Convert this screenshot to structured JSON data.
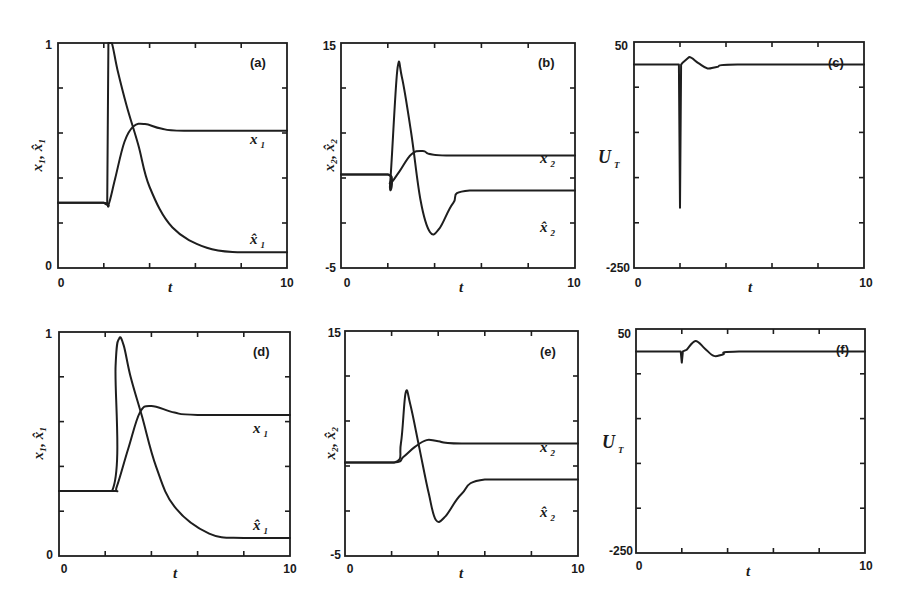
{
  "chart_data": [
    {
      "panel": "(a)",
      "type": "line",
      "xlabel": "t",
      "ylabel": "x1, x̂1",
      "xlim": [
        0,
        10
      ],
      "ylim": [
        0,
        1
      ],
      "xticks": [
        "0",
        "10"
      ],
      "yticks": [
        "0",
        "1"
      ],
      "series": [
        {
          "name": "x1",
          "x": [
            0,
            2.0,
            2.2,
            2.5,
            2.9,
            3.3,
            3.8,
            4.5,
            5.5,
            10
          ],
          "values": [
            0.29,
            0.29,
            0.28,
            0.4,
            0.56,
            0.63,
            0.64,
            0.62,
            0.61,
            0.61
          ]
        },
        {
          "name": "x̂1",
          "x": [
            0,
            2.0,
            2.15,
            2.2,
            2.35,
            2.6,
            3.0,
            3.5,
            4.0,
            5.0,
            6.5,
            8.0,
            10
          ],
          "values": [
            0.29,
            0.29,
            0.28,
            1.0,
            1.0,
            0.88,
            0.72,
            0.55,
            0.36,
            0.18,
            0.09,
            0.07,
            0.07
          ]
        }
      ]
    },
    {
      "panel": "(b)",
      "type": "line",
      "xlabel": "t",
      "ylabel": "x2, x̂2",
      "xlim": [
        0,
        10
      ],
      "ylim": [
        -5,
        15
      ],
      "xticks": [
        "0",
        "10"
      ],
      "yticks": [
        "-5",
        "15"
      ],
      "series": [
        {
          "name": "x2",
          "x": [
            0,
            2.0,
            2.1,
            2.5,
            3.0,
            3.5,
            4.5,
            10
          ],
          "values": [
            3.3,
            3.3,
            2.5,
            3.6,
            5.1,
            5.4,
            5.0,
            5.0
          ]
        },
        {
          "name": "x̂2",
          "x": [
            0,
            2.0,
            2.1,
            2.4,
            2.6,
            3.0,
            3.4,
            3.8,
            4.2,
            4.8,
            5.5,
            10
          ],
          "values": [
            3.3,
            3.3,
            2.5,
            12.5,
            12.0,
            7.0,
            1.0,
            -1.8,
            -1.5,
            0.8,
            1.9,
            1.9
          ]
        }
      ]
    },
    {
      "panel": "(c)",
      "type": "line",
      "xlabel": "t",
      "ylabel": "U_T",
      "xlim": [
        0,
        10
      ],
      "ylim": [
        -250,
        50
      ],
      "xticks": [
        "0",
        "10"
      ],
      "yticks": [
        "-250",
        "50"
      ],
      "series": [
        {
          "name": "U_T",
          "x": [
            0,
            1.95,
            2.0,
            2.05,
            2.1,
            2.4,
            2.8,
            3.2,
            3.6,
            4.5,
            10
          ],
          "values": [
            20,
            20,
            -170,
            20,
            22,
            30,
            22,
            15,
            17,
            20,
            20
          ]
        }
      ]
    },
    {
      "panel": "(d)",
      "type": "line",
      "xlabel": "t",
      "ylabel": "x1, x̂1",
      "xlim": [
        0,
        10
      ],
      "ylim": [
        0,
        1
      ],
      "xticks": [
        "0",
        "10"
      ],
      "yticks": [
        "0",
        "1"
      ],
      "series": [
        {
          "name": "x1",
          "x": [
            0,
            2.3,
            2.5,
            3.0,
            3.5,
            4.0,
            5.0,
            6.0,
            10
          ],
          "values": [
            0.29,
            0.29,
            0.31,
            0.48,
            0.64,
            0.67,
            0.64,
            0.63,
            0.63
          ]
        },
        {
          "name": "x̂1",
          "x": [
            0,
            2.3,
            2.45,
            2.6,
            2.8,
            3.1,
            3.6,
            4.2,
            5.0,
            6.5,
            8.0,
            10
          ],
          "values": [
            0.29,
            0.29,
            0.85,
            0.97,
            0.94,
            0.8,
            0.62,
            0.4,
            0.22,
            0.1,
            0.08,
            0.08
          ]
        }
      ]
    },
    {
      "panel": "(e)",
      "type": "line",
      "xlabel": "t",
      "ylabel": "x2, x̂2",
      "xlim": [
        0,
        10
      ],
      "ylim": [
        -5,
        15
      ],
      "xticks": [
        "0",
        "10"
      ],
      "yticks": [
        "-5",
        "15"
      ],
      "series": [
        {
          "name": "x2",
          "x": [
            0,
            2.1,
            2.5,
            3.0,
            3.5,
            4.0,
            5.0,
            10
          ],
          "values": [
            3.3,
            3.3,
            3.8,
            4.7,
            5.3,
            5.2,
            5.0,
            5.0
          ]
        },
        {
          "name": "x̂2",
          "x": [
            0,
            2.1,
            2.4,
            2.6,
            2.8,
            3.2,
            3.6,
            3.9,
            4.3,
            5.0,
            6.0,
            10
          ],
          "values": [
            3.3,
            3.3,
            5.0,
            9.5,
            8.5,
            4.5,
            0.5,
            -1.8,
            -1.5,
            0.5,
            1.8,
            1.8
          ]
        }
      ]
    },
    {
      "panel": "(f)",
      "type": "line",
      "xlabel": "t",
      "ylabel": "U_T",
      "xlim": [
        0,
        10
      ],
      "ylim": [
        -250,
        50
      ],
      "xticks": [
        "0",
        "10"
      ],
      "yticks": [
        "-250",
        "50"
      ],
      "series": [
        {
          "name": "U_T",
          "x": [
            0,
            1.95,
            2.0,
            2.05,
            2.2,
            2.6,
            3.0,
            3.4,
            3.8,
            4.5,
            10
          ],
          "values": [
            20,
            20,
            5,
            20,
            22,
            34,
            24,
            14,
            16,
            20,
            20
          ]
        }
      ]
    }
  ],
  "panels": {
    "a": {
      "tag": "(a)",
      "ytop": "1",
      "ybot": "0",
      "xleft": "0",
      "xright": "10",
      "xlabel": "t",
      "curve1": "x",
      "curve1_sub": "1",
      "curve2": "x̂",
      "curve2_sub": "1"
    },
    "b": {
      "tag": "(b)",
      "ytop": "15",
      "ybot": "-5",
      "xleft": "0",
      "xright": "10",
      "xlabel": "t",
      "curve1": "x",
      "curve1_sub": "2",
      "curve2": "x̂",
      "curve2_sub": "2"
    },
    "c": {
      "tag": "(c)",
      "ytop": "50",
      "ybot": "-250",
      "xleft": "0",
      "xright": "10",
      "xlabel": "t",
      "ylabel": "U",
      "ylabel_sub": "T"
    },
    "d": {
      "tag": "(d)",
      "ytop": "1",
      "ybot": "0",
      "xleft": "0",
      "xright": "10",
      "xlabel": "t",
      "curve1": "x",
      "curve1_sub": "1",
      "curve2": "x̂",
      "curve2_sub": "1"
    },
    "e": {
      "tag": "(e)",
      "ytop": "15",
      "ybot": "-5",
      "xleft": "0",
      "xright": "10",
      "xlabel": "t",
      "curve1": "x",
      "curve1_sub": "2",
      "curve2": "x̂",
      "curve2_sub": "2"
    },
    "f": {
      "tag": "(f)",
      "ytop": "50",
      "ybot": "-250",
      "xleft": "0",
      "xright": "10",
      "xlabel": "t",
      "ylabel": "U",
      "ylabel_sub": "T"
    }
  },
  "ylabels": {
    "x1": "x₁, x̂₁",
    "x2": "x₂, x̂₂"
  }
}
